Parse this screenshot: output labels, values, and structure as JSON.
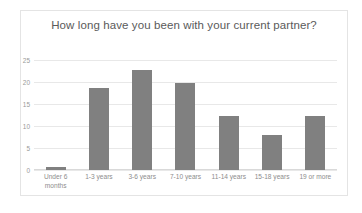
{
  "chart_data": {
    "type": "bar",
    "title": "How long have you been with your current partner?",
    "xlabel": "",
    "ylabel": "",
    "categories": [
      "Under 6 months",
      "1-3 years",
      "3-6 years",
      "7-10 years",
      "11-14 years",
      "15-18 years",
      "19 or more"
    ],
    "values": [
      0.7,
      18.7,
      22.7,
      19.8,
      12.2,
      8,
      12.2
    ],
    "ylim": [
      0,
      25
    ],
    "yticks": [
      0,
      5,
      10,
      15,
      20,
      25
    ],
    "ytick_labels": [
      "0",
      "5",
      "10",
      "15",
      "20",
      "25"
    ],
    "grid": true,
    "legend": "none",
    "bar_color": "#808080",
    "gridline_color": "#e8e8e8",
    "title_color": "#5a5a5a",
    "tick_color": "#9a9a9a",
    "background": "#ffffff"
  }
}
